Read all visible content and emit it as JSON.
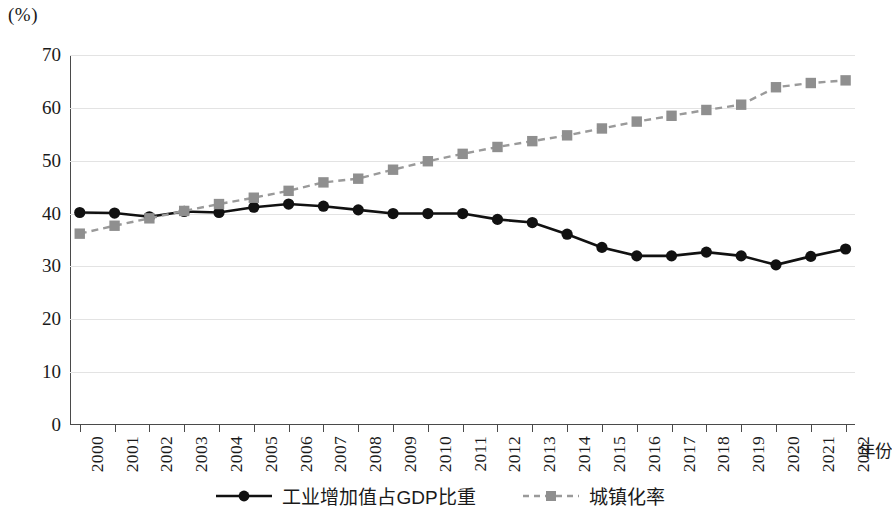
{
  "chart_data": {
    "type": "line",
    "title": "",
    "unit_label": "(%)",
    "xlabel": "年份",
    "ylabel": "",
    "ylim": [
      0,
      70
    ],
    "yticks": [
      0,
      10,
      20,
      30,
      40,
      50,
      60,
      70
    ],
    "grid": true,
    "legend_position": "bottom",
    "categories": [
      "2000",
      "2001",
      "2002",
      "2003",
      "2004",
      "2005",
      "2006",
      "2007",
      "2008",
      "2009",
      "2010",
      "2011",
      "2012",
      "2013",
      "2014",
      "2015",
      "2016",
      "2017",
      "2018",
      "2019",
      "2020",
      "2021",
      "2022"
    ],
    "series": [
      {
        "name": "工业增加值占GDP比重",
        "color": "#111111",
        "marker": "circle",
        "linestyle": "solid",
        "values": [
          40.2,
          40.1,
          39.4,
          40.4,
          40.2,
          41.2,
          41.8,
          41.4,
          40.7,
          40.0,
          40.0,
          40.0,
          38.9,
          38.3,
          36.1,
          33.6,
          32.0,
          32.0,
          32.7,
          32.0,
          30.3,
          31.9,
          33.3
        ]
      },
      {
        "name": "城镇化率",
        "color": "#9a9a9a",
        "marker": "square",
        "linestyle": "dashed",
        "values": [
          36.2,
          37.7,
          39.1,
          40.5,
          41.8,
          43.0,
          44.3,
          45.9,
          46.6,
          48.3,
          49.9,
          51.3,
          52.6,
          53.7,
          54.8,
          56.1,
          57.4,
          58.5,
          59.6,
          60.6,
          63.9,
          64.7,
          65.2
        ]
      }
    ]
  },
  "legend": {
    "items": [
      {
        "label": "工业增加值占GDP比重"
      },
      {
        "label": "城镇化率"
      }
    ]
  },
  "colors": {
    "industry_line": "#111111",
    "urbanization_line": "#9a9a9a",
    "axis": "#4a4a4a",
    "grid": "#e3e3e3",
    "background": "#ffffff"
  }
}
